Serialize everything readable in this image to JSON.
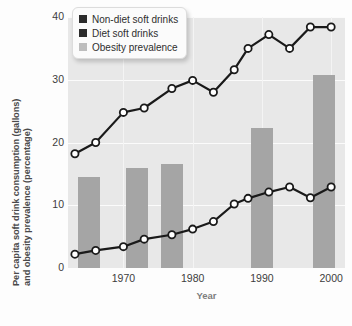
{
  "chart_data": {
    "type": "line",
    "title": "",
    "xlabel": "Year",
    "ylabel_line1": "Per capita soft drink consumption (gallons)",
    "ylabel_line2": "and obesity prevalence (percentage)",
    "xlim": [
      1962,
      2002
    ],
    "ylim": [
      0,
      40
    ],
    "yticks": [
      0,
      10,
      20,
      30,
      40
    ],
    "xticks": [
      1970,
      1980,
      1990,
      2000
    ],
    "grid": true,
    "legend_position": "top-left",
    "colors": {
      "line": "#1a1a1a",
      "marker_fill": "#ffffff",
      "bar": "#a5a5a5",
      "plot_background": "#e8e8e8",
      "gridline": "#fbfbfb"
    },
    "series": [
      {
        "name": "Non-diet soft drinks",
        "type": "line",
        "marker": "circle",
        "x": [
          1963,
          1966,
          1970,
          1973,
          1977,
          1980,
          1983,
          1986,
          1988,
          1991,
          1994,
          1997,
          2000
        ],
        "values": [
          18.2,
          20.0,
          24.8,
          25.5,
          28.6,
          29.9,
          28.0,
          31.6,
          35.0,
          37.2,
          35.0,
          38.4,
          38.4
        ]
      },
      {
        "name": "Diet soft drinks",
        "type": "line",
        "marker": "circle",
        "x": [
          1963,
          1966,
          1970,
          1973,
          1977,
          1980,
          1983,
          1986,
          1988,
          1991,
          1994,
          1997,
          2000
        ],
        "values": [
          2.2,
          2.8,
          3.4,
          4.6,
          5.3,
          6.2,
          7.4,
          10.2,
          11.1,
          12.1,
          12.9,
          11.2,
          12.9
        ]
      },
      {
        "name": "Obesity prevalence",
        "type": "bar",
        "x": [
          1965,
          1972,
          1977,
          1990,
          1999
        ],
        "values": [
          14.5,
          16.0,
          16.5,
          22.3,
          30.7
        ]
      }
    ]
  },
  "legend": {
    "items": [
      {
        "label": "Non-diet soft drinks",
        "swatch": "#2b2b2b"
      },
      {
        "label": "Diet soft drinks",
        "swatch": "#2b2b2b"
      },
      {
        "label": "Obesity prevalence",
        "swatch": "#bdbdbd"
      }
    ]
  }
}
